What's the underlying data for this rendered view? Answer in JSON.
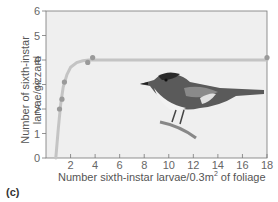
{
  "chart_data": {
    "type": "scatter",
    "title": "",
    "panel_label": "(c)",
    "xlabel": "Number sixth-instar larvae/0.3m2 of foliage",
    "ylabel": "Number of sixth-instar larvae/gizzard",
    "xlim": [
      0,
      18
    ],
    "ylim": [
      0,
      6
    ],
    "xticks": [
      2,
      4,
      6,
      8,
      10,
      12,
      14,
      16,
      18
    ],
    "yticks": [
      0,
      1,
      2,
      3,
      4,
      5,
      6
    ],
    "grid": false,
    "series": [
      {
        "name": "observed",
        "x": [
          1.1,
          1.3,
          1.5,
          3.4,
          3.8,
          18
        ],
        "y": [
          2.0,
          2.4,
          3.1,
          3.9,
          4.1,
          4.1
        ]
      }
    ],
    "fit_curve": {
      "description": "saturating functional response curve",
      "x": [
        0.8,
        1.0,
        1.2,
        1.4,
        1.7,
        2.0,
        2.5,
        3.0,
        3.5,
        4.0,
        6,
        10,
        18
      ],
      "y": [
        0.0,
        1.2,
        2.2,
        2.9,
        3.4,
        3.7,
        3.9,
        3.97,
        4.0,
        4.0,
        4.0,
        4.0,
        4.0
      ]
    },
    "annotations": [
      "bird illustration (warbler)"
    ]
  },
  "labels": {
    "xlabel_main": "Number sixth-instar larvae/0.3m",
    "xlabel_sup": "2",
    "xlabel_tail": " of foliage",
    "ylabel_line1": "Number of sixth-instar",
    "ylabel_line2": "larvae/gizzard",
    "panel": "(c)"
  },
  "colors": {
    "plot_bg": "#efefef",
    "axis": "#666666",
    "curve": "#bdbdbd",
    "points": "#9a9a9a"
  }
}
